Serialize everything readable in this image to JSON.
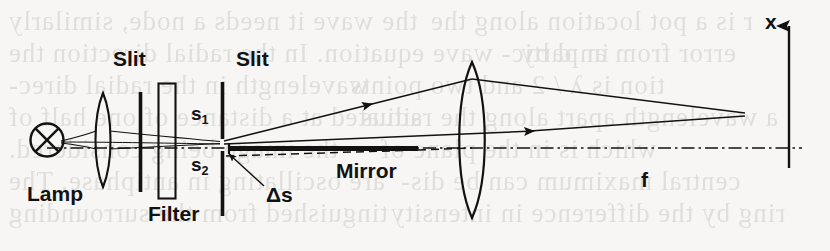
{
  "figure": {
    "background_color": "#f7f6f4",
    "ink_color": "#121212",
    "width": 830,
    "height": 251
  },
  "labels": {
    "lamp": "Lamp",
    "slit_first": "Slit",
    "slit_second": "Slit",
    "filter": "Filter",
    "source_upper": "s",
    "source_upper_sub": "1",
    "source_lower": "s",
    "source_lower_sub": "2",
    "delta_s": "Δs",
    "mirror": "Mirror",
    "focal_length": "f",
    "axis_x": "x"
  },
  "components": [
    {
      "name": "lamp",
      "type": "circle-with-cross",
      "x": 47,
      "y": 140,
      "r": 16
    },
    {
      "name": "condenser-lens",
      "type": "biconvex-lens",
      "x": 103,
      "y": 140,
      "half_height": 47,
      "half_width": 10
    },
    {
      "name": "first-slit",
      "type": "vertical-bar",
      "x": 140,
      "y_top": 92,
      "y_bottom": 192
    },
    {
      "name": "filter",
      "type": "hollow-rectangle",
      "x": 158,
      "y_top": 83,
      "width": 17,
      "height": 115
    },
    {
      "name": "second-slit",
      "type": "vertical-bar-with-aperture",
      "x": 222,
      "y_top": 82,
      "y_bottom": 216
    },
    {
      "name": "mirror",
      "type": "thick-horizontal-bar",
      "x_left": 228,
      "x_right": 418,
      "y": 148
    },
    {
      "name": "imaging-lens",
      "type": "biconvex-lens",
      "x": 472,
      "y": 140,
      "half_height": 78,
      "half_width": 15
    },
    {
      "name": "image-plane-axis",
      "type": "vertical-arrow-axis",
      "x": 789,
      "y_top": 22,
      "y_bottom": 168
    },
    {
      "name": "optical-axis",
      "type": "dash-dot-line",
      "y": 148,
      "x_left": 47,
      "x_right": 800
    }
  ],
  "rays": {
    "upper_ray_label": "ray-from-s1",
    "lower_ray_label": "ray-from-s2",
    "dashed_ray_label": "displaced-ray-delta-s",
    "convergence_point": {
      "x": 745,
      "y": 113
    },
    "arrowheads": [
      {
        "name": "upper-ray-arrowhead",
        "x": 358,
        "y": 108
      },
      {
        "name": "lower-ray-arrowhead",
        "x": 520,
        "y": 133
      }
    ]
  },
  "bleed_text": [
    {
      "text": "the wave it needs a node, similarly",
      "x": 8,
      "y": 6
    },
    {
      "text": "r is a pot location along the",
      "x": 430,
      "y": 6
    },
    {
      "text": "in partic- wave equation. In the radial direction the",
      "x": 8,
      "y": 38
    },
    {
      "text": "error from an d by",
      "x": 520,
      "y": 38
    },
    {
      "text": "wavelength in the radial direc-",
      "x": 8,
      "y": 70
    },
    {
      "text": "tion is λ / 2 and two points",
      "x": 350,
      "y": 70
    },
    {
      "text": "situated at a distance of one half of",
      "x": 8,
      "y": 102
    },
    {
      "text": "a wavelength apart along the radius",
      "x": 360,
      "y": 102
    },
    {
      "text": "the image being considered.",
      "x": 8,
      "y": 134
    },
    {
      "text": "which is in the plane of",
      "x": 380,
      "y": 134
    },
    {
      "text": "are oscillating in antiphase. The",
      "x": 8,
      "y": 166
    },
    {
      "text": "central maximum can be dis-",
      "x": 400,
      "y": 166
    },
    {
      "text": "tinguished from the surrounding",
      "x": 8,
      "y": 198
    },
    {
      "text": "ring by the difference in intensity",
      "x": 390,
      "y": 198
    }
  ]
}
